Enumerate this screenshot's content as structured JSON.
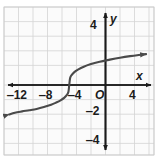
{
  "figure": {
    "background_color": "#ffffff",
    "grid_color": "#d0d0d0",
    "grid_fill": "#fbfbfb",
    "axis_color": "#1b1b1b",
    "curve_color": "#4a4a4a"
  },
  "chart_data": {
    "type": "line",
    "title": "",
    "xlabel": "x",
    "ylabel": "y",
    "xlim": [
      -14,
      6
    ],
    "ylim": [
      -5,
      5
    ],
    "grid": true,
    "legend": null,
    "origin_label": "O",
    "x_ticks": [
      -12,
      -8,
      -4,
      4
    ],
    "x_tick_labels": [
      "‒12",
      "‒8",
      "‒4",
      "4"
    ],
    "y_ticks": [
      4,
      -2,
      -4
    ],
    "y_tick_labels": [
      "4",
      "‒2",
      "‒4"
    ],
    "x_gridline_step": 2,
    "y_gridline_step": 1,
    "series": [
      {
        "name": "cube-root curve",
        "description": "y = cube root of (x + 5), increasing, inflection point at (-5, 0)",
        "arrow_start": true,
        "arrow_end": true,
        "inflection": [
          -5,
          0
        ],
        "x": [
          -13.3,
          -12.5,
          -11.5,
          -10.5,
          -9.5,
          -8.5,
          -7.5,
          -6.8,
          -6.2,
          -5.7,
          -5.35,
          -5.12,
          -5.0,
          -4.88,
          -4.65,
          -4.3,
          -3.8,
          -3.0,
          -2.0,
          -0.8,
          0.6,
          2.0,
          3.4,
          4.6,
          5.6
        ],
        "y": [
          -2.03,
          -1.91,
          -1.82,
          -1.74,
          -1.65,
          -1.52,
          -1.36,
          -1.21,
          -1.06,
          -0.89,
          -0.7,
          -0.49,
          0.0,
          0.49,
          0.7,
          0.89,
          1.06,
          1.26,
          1.44,
          1.61,
          1.75,
          1.88,
          1.99,
          2.07,
          2.13
        ]
      }
    ]
  }
}
